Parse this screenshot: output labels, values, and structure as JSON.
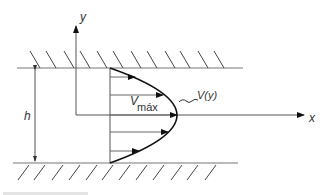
{
  "diagram": {
    "labels": {
      "y_axis": "y",
      "x_axis": "x",
      "height": "h",
      "v_max_main": "V",
      "v_max_sub": "máx",
      "velocity_function": "V(y)"
    },
    "colors": {
      "line": "#555555",
      "profile": "#111111",
      "hatch": "#444444",
      "text": "#333333"
    },
    "walls": [
      "top-wall",
      "bottom-wall"
    ],
    "profile_arrows": 5
  }
}
